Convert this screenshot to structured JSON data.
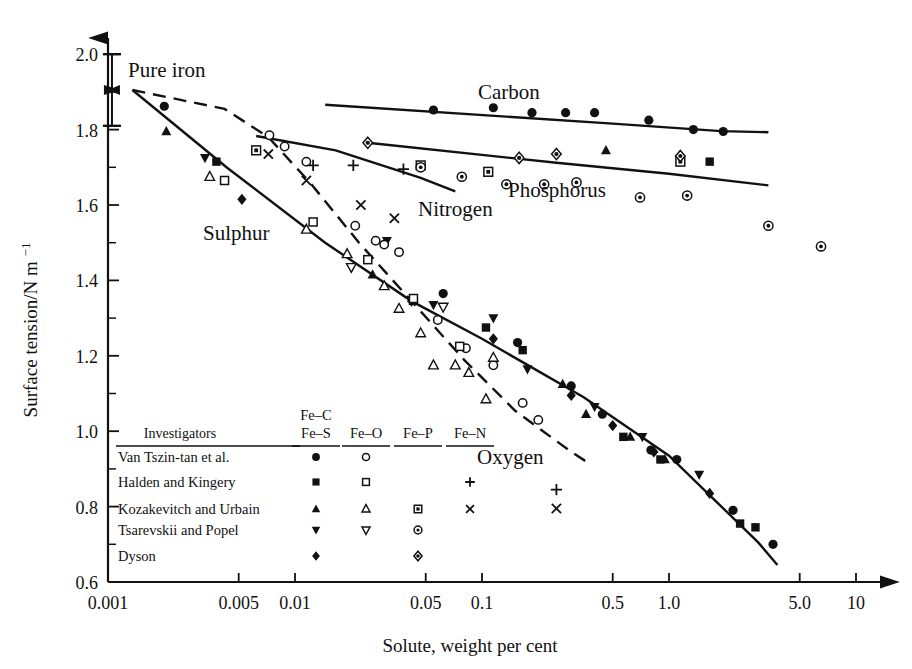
{
  "figure": {
    "xlabel": "Solute, weight per cent",
    "ylabel": "Surface tension/N m",
    "ylabel_exponent": "−1",
    "annotation_pure_iron": "Pure iron"
  },
  "axes": {
    "x_ticks": [
      "0.001",
      "0.005",
      "0.01",
      "0.05",
      "0.1",
      "0.5",
      "1.0",
      "5.0",
      "10"
    ],
    "x_tick_values": [
      0.001,
      0.005,
      0.01,
      0.05,
      0.1,
      0.5,
      1.0,
      5.0,
      10
    ],
    "y_ticks": [
      "2.0",
      "1.8",
      "1.6",
      "1.4",
      "1.2",
      "1.0",
      "0.8",
      "0.6"
    ],
    "y_tick_values": [
      2.0,
      1.8,
      1.6,
      1.4,
      1.2,
      1.0,
      0.8,
      0.6
    ],
    "y_minor_values": [
      1.9,
      1.7,
      1.5,
      1.3,
      1.1,
      0.9,
      0.7
    ],
    "xlim": [
      0.001,
      13.5
    ],
    "ylim": [
      0.6,
      2.04
    ],
    "xscale": "log"
  },
  "curve_labels": [
    {
      "name": "Carbon",
      "text": "Carbon",
      "x": 478,
      "y": 99
    },
    {
      "name": "Nitrogen",
      "text": "Nitrogen",
      "x": 418,
      "y": 216
    },
    {
      "name": "Phosphorus",
      "text": "Phosphorus",
      "x": 508,
      "y": 197
    },
    {
      "name": "Sulphur",
      "text": "Sulphur",
      "x": 203,
      "y": 240
    },
    {
      "name": "Oxygen",
      "text": "Oxygen",
      "x": 477,
      "y": 464
    }
  ],
  "legend": {
    "title": "Investigators",
    "columns": [
      "Fe–S",
      "Fe–O",
      "Fe–P",
      "Fe–N"
    ],
    "column_super": "Fe–C",
    "rows": [
      {
        "name": "Van Tszin-tan et al.",
        "FeS": "filled-circle",
        "FeO": "open-circle",
        "FeP": "",
        "FeN": ""
      },
      {
        "name": "Halden and Kingery",
        "FeS": "filled-square",
        "FeO": "open-square",
        "FeP": "",
        "FeN": "plus"
      },
      {
        "name": "Kozakevitch and Urbain",
        "FeS": "filled-triangle-up",
        "FeO": "open-triangle-up",
        "FeP": "dotted-square",
        "FeN": "cross"
      },
      {
        "name": "Tsarevskii and Popel",
        "FeS": "filled-triangle-down",
        "FeO": "open-triangle-down",
        "FeP": "dotted-circle",
        "FeN": ""
      },
      {
        "name": "Dyson",
        "FeS": "filled-diamond",
        "FeO": "",
        "FeP": "dotted-diamond",
        "FeN": ""
      }
    ]
  },
  "chart_data": {
    "type": "scatter",
    "title": "",
    "xlabel": "Solute, weight per cent",
    "ylabel": "Surface tension/N m−1",
    "xscale": "log",
    "xlim": [
      0.001,
      13.5
    ],
    "ylim": [
      0.6,
      2.04
    ],
    "grid": false,
    "legend_position": "lower-left-inside",
    "pure_iron_bar": {
      "x": 0.00105,
      "y_low": 1.81,
      "y_high": 2.0,
      "y_mark": 1.905
    },
    "curves": [
      {
        "name": "Carbon",
        "style": "solid",
        "points": [
          [
            0.0145,
            1.866
          ],
          [
            0.5,
            1.816
          ],
          [
            1.9,
            1.796
          ],
          [
            3.4,
            1.793
          ]
        ]
      },
      {
        "name": "Phosphorus",
        "style": "solid",
        "points": [
          [
            0.0245,
            1.765
          ],
          [
            0.25,
            1.712
          ],
          [
            1.0,
            1.683
          ],
          [
            3.4,
            1.652
          ]
        ]
      },
      {
        "name": "Nitrogen",
        "style": "solid",
        "points": [
          [
            0.0062,
            1.783
          ],
          [
            0.0165,
            1.745
          ],
          [
            0.047,
            1.672
          ],
          [
            0.072,
            1.636
          ]
        ]
      },
      {
        "name": "Sulphur",
        "style": "solid",
        "points": [
          [
            0.00135,
            1.905
          ],
          [
            0.0043,
            1.7
          ],
          [
            0.0145,
            1.5
          ],
          [
            0.042,
            1.345
          ],
          [
            0.1,
            1.245
          ],
          [
            0.35,
            1.09
          ],
          [
            1.0,
            0.935
          ],
          [
            3.0,
            0.705
          ],
          [
            3.8,
            0.645
          ]
        ]
      },
      {
        "name": "Oxygen",
        "style": "dashed",
        "points": [
          [
            0.00135,
            1.905
          ],
          [
            0.0042,
            1.855
          ],
          [
            0.0072,
            1.78
          ],
          [
            0.012,
            1.66
          ],
          [
            0.022,
            1.5
          ],
          [
            0.042,
            1.345
          ],
          [
            0.08,
            1.19
          ],
          [
            0.15,
            1.055
          ],
          [
            0.3,
            0.945
          ],
          [
            0.36,
            0.92
          ]
        ]
      }
    ],
    "series": [
      {
        "name": "Fe–S Van Tszin-tan et al.",
        "marker": "filled-circle",
        "points": [
          [
            0.002,
            1.862
          ],
          [
            0.062,
            1.365
          ],
          [
            0.155,
            1.235
          ],
          [
            0.3,
            1.12
          ],
          [
            0.44,
            1.045
          ],
          [
            0.8,
            0.95
          ],
          [
            1.1,
            0.925
          ],
          [
            2.2,
            0.79
          ],
          [
            3.6,
            0.7
          ]
        ]
      },
      {
        "name": "Fe–S Halden and Kingery",
        "marker": "filled-square",
        "points": [
          [
            0.0038,
            1.715
          ],
          [
            0.105,
            1.275
          ],
          [
            0.165,
            1.215
          ],
          [
            0.57,
            0.985
          ],
          [
            0.9,
            0.925
          ],
          [
            2.4,
            0.755
          ],
          [
            2.9,
            0.745
          ]
        ]
      },
      {
        "name": "Fe–S Kozakevitch and Urbain",
        "marker": "filled-triangle-up",
        "points": [
          [
            0.00205,
            1.795
          ],
          [
            0.026,
            1.415
          ],
          [
            0.043,
            1.345
          ],
          [
            0.27,
            1.125
          ],
          [
            0.36,
            1.045
          ],
          [
            0.62,
            0.985
          ],
          [
            0.95,
            0.925
          ]
        ]
      },
      {
        "name": "Fe–S Tsarevskii and Popel",
        "marker": "filled-triangle-down",
        "points": [
          [
            0.0033,
            1.725
          ],
          [
            0.031,
            1.505
          ],
          [
            0.055,
            1.335
          ],
          [
            0.115,
            1.3
          ],
          [
            0.175,
            1.165
          ],
          [
            0.4,
            1.065
          ],
          [
            0.72,
            0.985
          ],
          [
            1.45,
            0.885
          ]
        ]
      },
      {
        "name": "Fe–S Dyson",
        "marker": "filled-diamond",
        "points": [
          [
            0.0052,
            1.615
          ],
          [
            0.042,
            1.345
          ],
          [
            0.115,
            1.245
          ],
          [
            0.3,
            1.095
          ],
          [
            0.5,
            1.015
          ],
          [
            0.83,
            0.945
          ],
          [
            1.65,
            0.835
          ]
        ]
      },
      {
        "name": "Fe–O Van Tszin-tan et al.",
        "marker": "open-circle",
        "points": [
          [
            0.0073,
            1.785
          ],
          [
            0.0088,
            1.755
          ],
          [
            0.0115,
            1.715
          ],
          [
            0.021,
            1.545
          ],
          [
            0.027,
            1.505
          ],
          [
            0.03,
            1.495
          ],
          [
            0.036,
            1.475
          ],
          [
            0.058,
            1.295
          ],
          [
            0.082,
            1.22
          ],
          [
            0.115,
            1.175
          ],
          [
            0.165,
            1.075
          ],
          [
            0.2,
            1.03
          ]
        ]
      },
      {
        "name": "Fe–O Halden and Kingery",
        "marker": "open-square",
        "points": [
          [
            0.0042,
            1.665
          ],
          [
            0.0125,
            1.555
          ],
          [
            0.0245,
            1.455
          ],
          [
            0.043,
            1.352
          ],
          [
            0.076,
            1.225
          ]
        ]
      },
      {
        "name": "Fe–O Kozakevitch and Urbain",
        "marker": "open-triangle-up",
        "points": [
          [
            0.0035,
            1.675
          ],
          [
            0.0115,
            1.535
          ],
          [
            0.019,
            1.47
          ],
          [
            0.03,
            1.385
          ],
          [
            0.036,
            1.325
          ],
          [
            0.047,
            1.26
          ],
          [
            0.055,
            1.175
          ],
          [
            0.072,
            1.175
          ],
          [
            0.085,
            1.155
          ],
          [
            0.105,
            1.085
          ],
          [
            0.115,
            1.195
          ]
        ]
      },
      {
        "name": "Fe–O Tsarevskii and Popel",
        "marker": "open-triangle-down",
        "points": [
          [
            0.02,
            1.435
          ],
          [
            0.062,
            1.33
          ]
        ]
      },
      {
        "name": "Fe–N Halden and Kingery",
        "marker": "plus",
        "points": [
          [
            0.0125,
            1.705
          ],
          [
            0.0205,
            1.705
          ],
          [
            0.038,
            1.695
          ],
          [
            0.25,
            0.845
          ]
        ]
      },
      {
        "name": "Fe–N Kozakevitch and Urbain",
        "marker": "cross",
        "points": [
          [
            0.0072,
            1.735
          ],
          [
            0.0115,
            1.665
          ],
          [
            0.0225,
            1.6
          ],
          [
            0.034,
            1.565
          ],
          [
            0.25,
            0.795
          ]
        ]
      },
      {
        "name": "Fe–C Van Tszin-tan et al.",
        "marker": "filled-circle",
        "points": [
          [
            0.055,
            1.852
          ],
          [
            0.115,
            1.858
          ],
          [
            0.185,
            1.845
          ],
          [
            0.28,
            1.845
          ],
          [
            0.4,
            1.845
          ],
          [
            0.78,
            1.825
          ],
          [
            1.35,
            1.8
          ],
          [
            1.95,
            1.795
          ]
        ]
      },
      {
        "name": "Fe–P Kozakevitch and Urbain",
        "marker": "dotted-square",
        "points": [
          [
            0.0062,
            1.745
          ],
          [
            0.047,
            1.705
          ],
          [
            0.108,
            1.688
          ],
          [
            1.15,
            1.715
          ]
        ]
      },
      {
        "name": "Fe–P Tsarevskii and Popel",
        "marker": "dotted-circle",
        "points": [
          [
            0.047,
            1.7
          ],
          [
            0.078,
            1.675
          ],
          [
            0.135,
            1.655
          ],
          [
            0.215,
            1.655
          ],
          [
            0.32,
            1.66
          ],
          [
            0.7,
            1.62
          ],
          [
            1.25,
            1.625
          ],
          [
            3.4,
            1.545
          ],
          [
            6.5,
            1.49
          ]
        ]
      },
      {
        "name": "Fe–P Dyson",
        "marker": "dotted-diamond",
        "points": [
          [
            0.0245,
            1.765
          ],
          [
            0.158,
            1.725
          ],
          [
            0.25,
            1.735
          ],
          [
            1.15,
            1.73
          ]
        ]
      },
      {
        "name": "Fe–P Halden and Kingery",
        "marker": "filled-square",
        "points": [
          [
            1.65,
            1.715
          ]
        ]
      },
      {
        "name": "Fe–P Kozakevitch and Urbain tri",
        "marker": "filled-triangle-up",
        "points": [
          [
            0.46,
            1.745
          ]
        ]
      }
    ]
  }
}
